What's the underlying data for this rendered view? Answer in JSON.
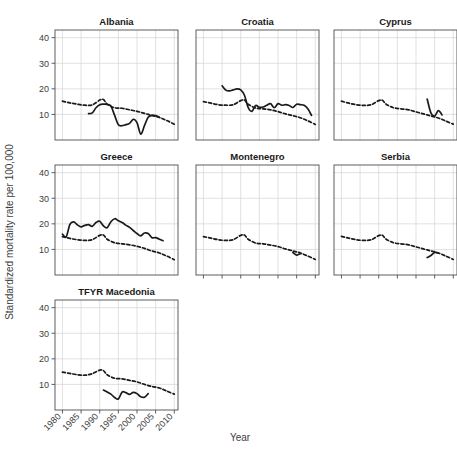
{
  "chart_data": {
    "type": "line",
    "title": "",
    "xlabel": "Year",
    "ylabel": "Standardized mortality rate per 100,000",
    "xlim": [
      1978,
      2011
    ],
    "ylim": [
      0,
      43
    ],
    "xticks": [
      1980,
      1985,
      1990,
      1995,
      2000,
      2005,
      2010
    ],
    "xtick_labels": [
      "1980",
      "1985",
      "1990",
      "1995",
      "2000",
      "2005",
      "2010"
    ],
    "yticks": [
      10,
      20,
      30,
      40
    ],
    "ytick_labels": [
      "10",
      "20",
      "30",
      "40"
    ],
    "grid": true,
    "legend_position": "none",
    "facet_layout": {
      "rows": 3,
      "cols": 3,
      "free_cells": [
        "r3c2",
        "r3c3"
      ]
    },
    "series_styles": [
      {
        "name": "national",
        "style": "solid",
        "color": "#1a1a1a"
      },
      {
        "name": "reference",
        "style": "dashed",
        "color": "#1a1a1a"
      }
    ],
    "panels": [
      {
        "name": "Albania",
        "row": 1,
        "col": 1,
        "series": [
          {
            "name": "national",
            "style": "solid",
            "x": [
              1987,
              1988,
              1989,
              1990,
              1991,
              1992,
              1993,
              1994,
              1995,
              1996,
              1997,
              1998,
              1999,
              2000,
              2001,
              2002,
              2003,
              2004,
              2005,
              2006
            ],
            "y": [
              10.3,
              10.6,
              12.6,
              13.8,
              14.0,
              13.9,
              13.3,
              9.6,
              6.0,
              5.6,
              6.0,
              6.5,
              8.1,
              6.8,
              2.3,
              5.6,
              8.9,
              9.6,
              9.5,
              8.9
            ]
          },
          {
            "name": "reference",
            "style": "dashed",
            "x": [
              1980,
              1982,
              1984,
              1986,
              1988,
              1990,
              1991,
              1992,
              1994,
              1996,
              1998,
              2000,
              2002,
              2004,
              2006,
              2008,
              2010
            ],
            "y": [
              15.2,
              14.5,
              14.0,
              13.6,
              13.7,
              15.6,
              15.8,
              14.0,
              12.6,
              12.4,
              11.8,
              11.2,
              10.4,
              9.6,
              8.8,
              7.6,
              6.2
            ]
          }
        ]
      },
      {
        "name": "Croatia",
        "row": 1,
        "col": 2,
        "series": [
          {
            "name": "national",
            "style": "solid",
            "x": [
              1985,
              1986,
              1987,
              1988,
              1989,
              1990,
              1991,
              1992,
              1993,
              1994,
              1995,
              1996,
              1997,
              1998,
              1999,
              2000,
              2001,
              2002,
              2003,
              2004,
              2005,
              2006,
              2007,
              2008,
              2009
            ],
            "y": [
              21.2,
              19.5,
              19.2,
              19.6,
              20.0,
              19.6,
              17.5,
              12.7,
              11.2,
              13.5,
              12.8,
              12.9,
              13.6,
              14.2,
              12.6,
              14.2,
              13.6,
              13.8,
              13.5,
              12.7,
              14.0,
              13.8,
              13.6,
              12.2,
              9.6
            ]
          },
          {
            "name": "reference",
            "style": "dashed",
            "x": [
              1980,
              1982,
              1984,
              1986,
              1988,
              1990,
              1991,
              1992,
              1994,
              1996,
              1998,
              2000,
              2002,
              2004,
              2006,
              2008,
              2010
            ],
            "y": [
              15.0,
              14.4,
              13.8,
              13.6,
              13.8,
              15.4,
              15.6,
              14.0,
              12.5,
              12.2,
              11.8,
              11.1,
              10.2,
              9.5,
              8.7,
              7.5,
              6.1
            ]
          }
        ]
      },
      {
        "name": "Cyprus",
        "row": 1,
        "col": 3,
        "series": [
          {
            "name": "national",
            "style": "solid",
            "x": [
              2003,
              2004,
              2005,
              2006,
              2007
            ],
            "y": [
              16.0,
              10.6,
              9.4,
              11.5,
              9.8
            ]
          },
          {
            "name": "reference",
            "style": "dashed",
            "x": [
              1980,
              1982,
              1984,
              1986,
              1988,
              1990,
              1991,
              1992,
              1994,
              1996,
              1998,
              2000,
              2002,
              2004,
              2006,
              2008,
              2010
            ],
            "y": [
              15.2,
              14.4,
              13.8,
              13.5,
              13.8,
              15.4,
              15.5,
              14.0,
              12.6,
              12.2,
              11.8,
              11.0,
              10.2,
              9.4,
              8.6,
              7.4,
              6.2
            ]
          }
        ]
      },
      {
        "name": "Greece",
        "row": 2,
        "col": 1,
        "series": [
          {
            "name": "national",
            "style": "solid",
            "x": [
              1980,
              1981,
              1982,
              1983,
              1984,
              1985,
              1986,
              1987,
              1988,
              1989,
              1990,
              1991,
              1992,
              1993,
              1994,
              1995,
              1996,
              1997,
              1998,
              1999,
              2000,
              2001,
              2002,
              2003,
              2004,
              2005,
              2006,
              2007
            ],
            "y": [
              16.0,
              14.9,
              19.8,
              20.8,
              19.6,
              18.8,
              19.4,
              19.7,
              19.0,
              20.5,
              21.0,
              19.2,
              18.5,
              20.8,
              22.0,
              21.2,
              20.5,
              19.5,
              18.6,
              17.4,
              16.2,
              15.3,
              16.4,
              16.2,
              14.6,
              14.6,
              14.0,
              13.4
            ]
          },
          {
            "name": "reference",
            "style": "dashed",
            "x": [
              1980,
              1982,
              1984,
              1986,
              1988,
              1990,
              1991,
              1992,
              1994,
              1996,
              1998,
              2000,
              2002,
              2004,
              2006,
              2008,
              2010
            ],
            "y": [
              15.0,
              14.3,
              13.8,
              13.5,
              13.8,
              15.5,
              15.6,
              14.0,
              12.6,
              12.2,
              11.8,
              11.2,
              10.4,
              9.4,
              8.6,
              7.4,
              6.0
            ]
          }
        ]
      },
      {
        "name": "Montenegro",
        "row": 2,
        "col": 2,
        "series": [
          {
            "name": "national",
            "style": "solid",
            "x": [
              2004,
              2005,
              2006
            ],
            "y": [
              8.8,
              7.8,
              8.3
            ]
          },
          {
            "name": "reference",
            "style": "dashed",
            "x": [
              1980,
              1982,
              1984,
              1986,
              1988,
              1990,
              1991,
              1992,
              1994,
              1996,
              1998,
              2000,
              2002,
              2004,
              2006,
              2008,
              2010
            ],
            "y": [
              15.0,
              14.4,
              13.8,
              13.5,
              13.8,
              15.5,
              15.6,
              14.0,
              12.5,
              12.2,
              11.7,
              11.1,
              10.2,
              9.4,
              8.6,
              7.4,
              6.1
            ]
          }
        ]
      },
      {
        "name": "Serbia",
        "row": 2,
        "col": 3,
        "series": [
          {
            "name": "national",
            "style": "solid",
            "x": [
              2003,
              2004,
              2005,
              2006
            ],
            "y": [
              6.8,
              7.6,
              8.8,
              8.6
            ]
          },
          {
            "name": "reference",
            "style": "dashed",
            "x": [
              1980,
              1982,
              1984,
              1986,
              1988,
              1990,
              1991,
              1992,
              1994,
              1996,
              1998,
              2000,
              2002,
              2004,
              2006,
              2008,
              2010
            ],
            "y": [
              15.1,
              14.4,
              13.8,
              13.5,
              13.8,
              15.4,
              15.5,
              14.0,
              12.6,
              12.2,
              11.8,
              11.0,
              10.2,
              9.4,
              8.6,
              7.4,
              6.1
            ]
          }
        ]
      },
      {
        "name": "TFYR Macedonia",
        "row": 3,
        "col": 1,
        "series": [
          {
            "name": "national",
            "style": "solid",
            "x": [
              1991,
              1992,
              1993,
              1994,
              1995,
              1996,
              1997,
              1998,
              1999,
              2000,
              2001,
              2002,
              2003
            ],
            "y": [
              7.8,
              7.0,
              6.2,
              4.9,
              4.3,
              7.0,
              6.8,
              6.1,
              6.9,
              6.4,
              5.2,
              5.0,
              6.4
            ]
          },
          {
            "name": "reference",
            "style": "dashed",
            "x": [
              1980,
              1982,
              1984,
              1986,
              1988,
              1990,
              1991,
              1992,
              1994,
              1996,
              1998,
              2000,
              2002,
              2004,
              2006,
              2008,
              2010
            ],
            "y": [
              14.8,
              14.3,
              13.8,
              13.6,
              14.2,
              15.6,
              15.4,
              13.8,
              12.4,
              12.2,
              11.6,
              11.0,
              10.0,
              9.2,
              8.6,
              7.4,
              6.2
            ]
          }
        ]
      }
    ]
  }
}
